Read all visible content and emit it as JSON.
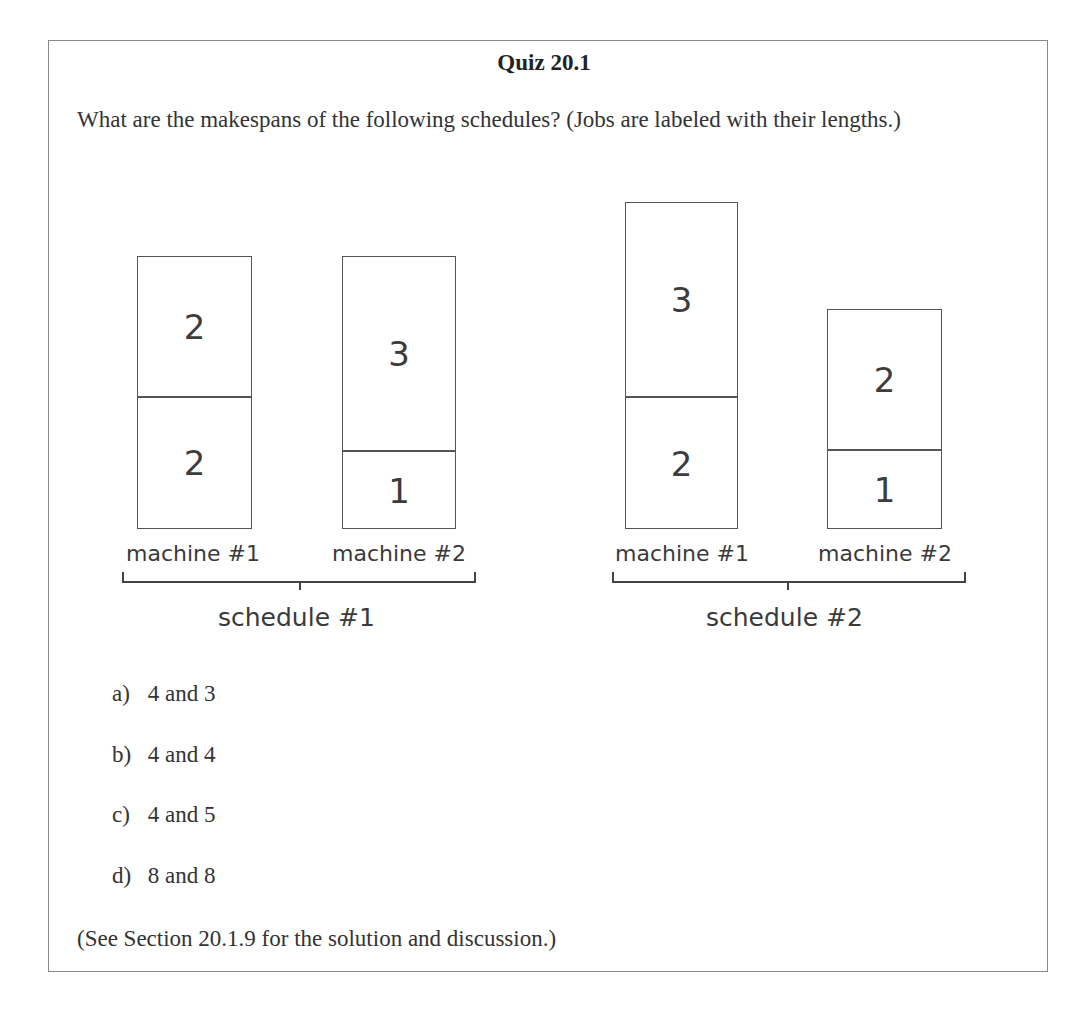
{
  "quiz": {
    "title": "Quiz 20.1",
    "question": "What are the makespans of the following schedules? (Jobs are labeled with their lengths.)",
    "schedules": [
      {
        "label": "schedule #1",
        "machines": [
          {
            "label": "machine #1",
            "jobs_bottom_to_top": [
              "2",
              "2"
            ]
          },
          {
            "label": "machine #2",
            "jobs_bottom_to_top": [
              "1",
              "3"
            ]
          }
        ]
      },
      {
        "label": "schedule #2",
        "machines": [
          {
            "label": "machine #1",
            "jobs_bottom_to_top": [
              "2",
              "3"
            ]
          },
          {
            "label": "machine #2",
            "jobs_bottom_to_top": [
              "1",
              "2"
            ]
          }
        ]
      }
    ],
    "options": [
      {
        "letter": "a)",
        "text": "4 and 3"
      },
      {
        "letter": "b)",
        "text": "4 and 4"
      },
      {
        "letter": "c)",
        "text": "4 and 5"
      },
      {
        "letter": "d)",
        "text": "8 and 8"
      }
    ],
    "footer": "(See Section 20.1.9 for the solution and discussion.)"
  }
}
